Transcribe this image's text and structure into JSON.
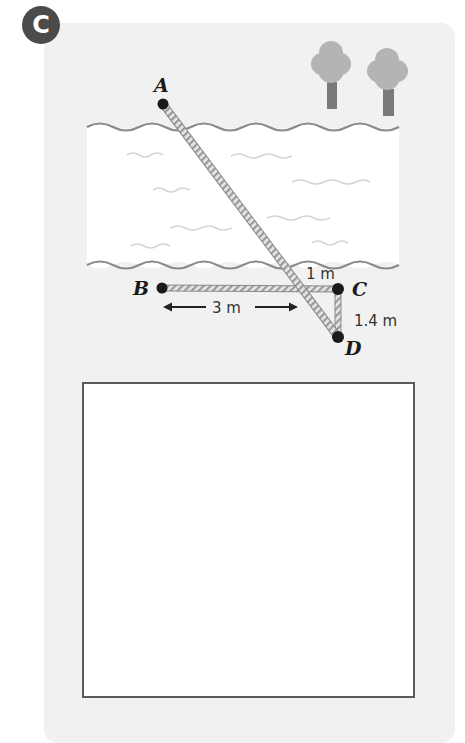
{
  "question": {
    "badge_label": "C"
  },
  "diagram": {
    "points": {
      "A": {
        "label": "A",
        "x": 163,
        "y": 104
      },
      "B": {
        "label": "B",
        "x": 162,
        "y": 288
      },
      "C": {
        "label": "C",
        "x": 338,
        "y": 289
      },
      "D": {
        "label": "D",
        "x": 338,
        "y": 337
      }
    },
    "measurements": {
      "BC_segment_label": "3 m",
      "crossing_to_C_label": "1 m",
      "CD_label": "1.4 m"
    },
    "scene": {
      "river": "water between two wavy banks",
      "trees": 2,
      "ropes": [
        "A-D",
        "B-C",
        "C-D"
      ]
    },
    "colors": {
      "card_background": "#f1f1f1",
      "badge": "#4b4b4b",
      "water": "#ffffff",
      "bank_line": "#8a8a8a",
      "ripple": "#d4d4d4",
      "rope": "#9a9a9a",
      "point": "#1a1a1a",
      "tree_canopy": "#b4b4b4",
      "tree_trunk": "#7a7a7a",
      "answer_box_border": "#5a5a5a"
    }
  },
  "answer_box": {
    "content": ""
  }
}
